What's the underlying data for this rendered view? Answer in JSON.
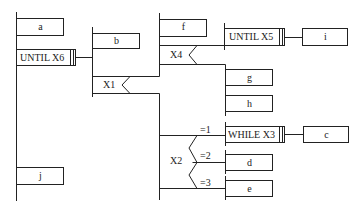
{
  "diagram": {
    "type": "PAD / structured flow diagram",
    "boxes": {
      "a": "a",
      "until_x6": "UNTIL  X6",
      "b": "b",
      "x1": "X1",
      "f": "f",
      "x4": "X4",
      "until_x5": "UNTIL X5",
      "i": "i",
      "g": "g",
      "h": "h",
      "x2": "X2",
      "case1": "=1",
      "case2": "=2",
      "case3": "=3",
      "while_x3": "WHILE  X3",
      "c": "c",
      "d": "d",
      "e": "e",
      "j": "j"
    },
    "colors": {
      "line": "#222222",
      "background": "#ffffff"
    }
  }
}
